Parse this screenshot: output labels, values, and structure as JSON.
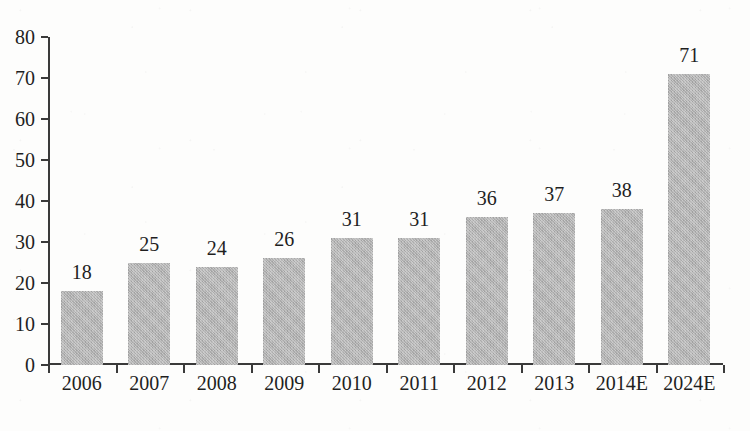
{
  "chart_data": {
    "type": "bar",
    "title": "",
    "subtitle": "",
    "xlabel": "",
    "ylabel": "",
    "categories": [
      "2006",
      "2007",
      "2008",
      "2009",
      "2010",
      "2011",
      "2012",
      "2013",
      "2014E",
      "2024E"
    ],
    "values": [
      18,
      25,
      24,
      26,
      31,
      31,
      36,
      37,
      38,
      71
    ],
    "data_labels": [
      "18",
      "25",
      "24",
      "26",
      "31",
      "31",
      "36",
      "37",
      "38",
      "71"
    ],
    "ylim": [
      0,
      80
    ],
    "y_ticks": [
      0,
      10,
      20,
      30,
      40,
      50,
      60,
      70,
      80
    ],
    "y_tick_labels": [
      "0",
      "10",
      "20",
      "30",
      "40",
      "50",
      "60",
      "70",
      "80"
    ],
    "grid": false,
    "legend": null,
    "legend_position": "none",
    "series": [
      {
        "name": "",
        "values": [
          18,
          25,
          24,
          26,
          31,
          31,
          36,
          37,
          38,
          71
        ]
      }
    ]
  },
  "style": {
    "bar_color": "#b3b3b3",
    "axis_color": "#3a3a3a",
    "text_color": "#1f1f1f",
    "background_color": "#fdfdfc"
  }
}
